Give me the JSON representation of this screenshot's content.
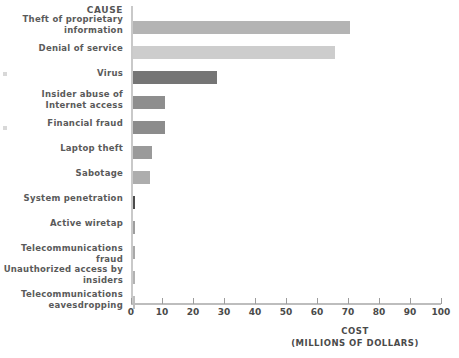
{
  "chart_data": {
    "type": "bar",
    "orientation": "horizontal",
    "title": "",
    "xlabel": "COST",
    "xlabel_sub": "(MILLIONS OF DOLLARS)",
    "ylabel": "CAUSE",
    "xlim": [
      0,
      100
    ],
    "xticks": [
      0,
      10,
      20,
      30,
      40,
      50,
      60,
      70,
      80,
      90,
      100
    ],
    "xtick_labels": [
      "0",
      "10",
      "20",
      "30",
      "40",
      "50",
      "60",
      "70",
      "80",
      "90",
      "100"
    ],
    "grid": false,
    "legend": "none",
    "categories": [
      "Theft of proprietary information",
      "Denial of service",
      "Virus",
      "Insider abuse of Internet access",
      "Financial fraud",
      "Laptop theft",
      "Sabotage",
      "System penetration",
      "Active wiretap",
      "Telecommunications fraud",
      "Unauthorized access by insiders",
      "Telecommunications eavesdropping"
    ],
    "values": [
      70,
      65,
      27,
      10.3,
      10.3,
      6,
      5.5,
      0.7,
      0.5,
      0.4,
      0.3,
      0.3
    ],
    "bar_colors": [
      "#b4b4b4",
      "#cdcdcd",
      "#757575",
      "#8e8e8e",
      "#8c8c8c",
      "#9a9a9a",
      "#adadad",
      "#4b4b4b",
      "#9e9e9e",
      "#a8a8a8",
      "#b2b2b2",
      "#bdbdbd"
    ]
  },
  "rows": [
    {
      "label_line1": "Theft of proprietary",
      "label_line2": "information",
      "value": 70,
      "color": "#b4b4b4"
    },
    {
      "label_line1": "Denial of service",
      "label_line2": "",
      "value": 65,
      "color": "#cdcdcd"
    },
    {
      "label_line1": "Virus",
      "label_line2": "",
      "value": 27,
      "color": "#757575"
    },
    {
      "label_line1": "Insider abuse of",
      "label_line2": "Internet access",
      "value": 10.3,
      "color": "#8e8e8e"
    },
    {
      "label_line1": "Financial fraud",
      "label_line2": "",
      "value": 10.3,
      "color": "#8c8c8c"
    },
    {
      "label_line1": "Laptop theft",
      "label_line2": "",
      "value": 6,
      "color": "#9a9a9a"
    },
    {
      "label_line1": "Sabotage",
      "label_line2": "",
      "value": 5.5,
      "color": "#adadad"
    },
    {
      "label_line1": "System penetration",
      "label_line2": "",
      "value": 0.7,
      "color": "#4b4b4b"
    },
    {
      "label_line1": "Active wiretap",
      "label_line2": "",
      "value": 0.5,
      "color": "#9e9e9e"
    },
    {
      "label_line1": "Telecommunications fraud",
      "label_line2": "",
      "value": 0.4,
      "color": "#a8a8a8"
    },
    {
      "label_line1": "Unauthorized access by",
      "label_line2": "insiders",
      "value": 0.3,
      "color": "#b2b2b2"
    },
    {
      "label_line1": "Telecommunications",
      "label_line2": "eavesdropping",
      "value": 0.3,
      "color": "#bdbdbd"
    }
  ],
  "header": {
    "cause": "CAUSE"
  },
  "axis": {
    "cost_title": "COST",
    "cost_units": "(MILLIONS OF DOLLARS)"
  }
}
